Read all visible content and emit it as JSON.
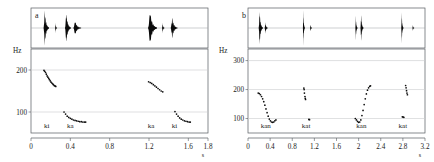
{
  "figure": {
    "caption_letters": [
      "a",
      "b"
    ],
    "kind": "speech-waveform-and-pitch-contour"
  },
  "panels": [
    {
      "letter": "a",
      "y_axis_label": "Hz",
      "x_unit_label": "s",
      "syllable_labels": [
        "ki",
        "ka",
        "ka",
        "ki"
      ],
      "syllable_x": [
        0.16,
        0.4,
        1.22,
        1.46
      ]
    },
    {
      "letter": "b",
      "y_axis_label": "Hz",
      "x_unit_label": "s",
      "syllable_labels": [
        "kan",
        "kat",
        "kan",
        "kat"
      ],
      "syllable_x": [
        0.32,
        1.05,
        2.05,
        2.8
      ]
    }
  ],
  "chart_data": [
    {
      "type": "line",
      "title": "a",
      "xlabel": "s",
      "ylabel": "Hz",
      "xlim": [
        0,
        1.8
      ],
      "ylim": [
        50,
        250
      ],
      "xticks": [
        0,
        0.4,
        0.8,
        1.2,
        1.6,
        1.8
      ],
      "xticklabels": [
        "0",
        "0.4",
        "0.8",
        "1.2",
        "1.6",
        "1.8"
      ],
      "yticks": [
        100,
        200
      ],
      "yticklabels": [
        "100",
        "200"
      ],
      "grid": true,
      "legend": "none",
      "annotations": [
        {
          "text": "ki",
          "x": 0.16,
          "y": 62
        },
        {
          "text": "ka",
          "x": 0.4,
          "y": 62
        },
        {
          "text": "ka",
          "x": 1.22,
          "y": 62
        },
        {
          "text": "ki",
          "x": 1.46,
          "y": 62
        }
      ],
      "series": [
        {
          "name": "f0-ki-1",
          "x": [
            0.132,
            0.14,
            0.148,
            0.156,
            0.164,
            0.172,
            0.18,
            0.188,
            0.196,
            0.204,
            0.212,
            0.22,
            0.228,
            0.236,
            0.244,
            0.252
          ],
          "y": [
            199,
            197,
            194,
            190,
            186,
            183,
            180,
            177,
            174,
            171,
            169,
            167,
            165,
            163,
            162,
            161
          ]
        },
        {
          "name": "f0-ka-1",
          "x": [
            0.336,
            0.352,
            0.368,
            0.384,
            0.4,
            0.416,
            0.432,
            0.448,
            0.464,
            0.48,
            0.496,
            0.512,
            0.528,
            0.544,
            0.556
          ],
          "y": [
            100,
            95,
            90,
            87,
            85,
            83,
            81,
            80,
            79,
            78,
            77,
            77,
            76,
            76,
            76
          ]
        },
        {
          "name": "f0-ka-2",
          "x": [
            1.196,
            1.212,
            1.228,
            1.244,
            1.26,
            1.276,
            1.292,
            1.308,
            1.324,
            1.34
          ],
          "y": [
            172,
            170,
            168,
            165,
            162,
            159,
            156,
            153,
            150,
            148
          ]
        },
        {
          "name": "f0-ki-2",
          "x": [
            1.464,
            1.48,
            1.496,
            1.512,
            1.528,
            1.544,
            1.56,
            1.576,
            1.592,
            1.608,
            1.62
          ],
          "y": [
            101,
            95,
            90,
            86,
            83,
            81,
            79,
            78,
            77,
            76,
            76
          ]
        }
      ],
      "waveform_bursts": [
        {
          "center": 0.155,
          "width": 0.055,
          "peak": 1.0
        },
        {
          "center": 0.255,
          "width": 0.02,
          "peak": 0.28
        },
        {
          "center": 0.375,
          "width": 0.06,
          "peak": 0.92
        },
        {
          "center": 0.47,
          "width": 0.08,
          "peak": 0.42
        },
        {
          "center": 1.235,
          "width": 0.09,
          "peak": 1.0
        },
        {
          "center": 1.345,
          "width": 0.025,
          "peak": 0.3
        },
        {
          "center": 1.455,
          "width": 0.07,
          "peak": 0.6
        }
      ]
    },
    {
      "type": "line",
      "title": "b",
      "xlabel": "s",
      "ylabel": "Hz",
      "xlim": [
        0,
        3.2
      ],
      "ylim": [
        50,
        340
      ],
      "xticks": [
        0,
        0.4,
        0.8,
        1.2,
        1.6,
        2,
        2.4,
        2.8,
        3.2
      ],
      "xticklabels": [
        "0",
        "0.4",
        "0.8",
        "1.2",
        "1.6",
        "2",
        "2.4",
        "2.8",
        "3.2"
      ],
      "yticks": [
        100,
        200,
        300
      ],
      "yticklabels": [
        "100",
        "200",
        "300"
      ],
      "grid": true,
      "legend": "none",
      "annotations": [
        {
          "text": "kan",
          "x": 0.32,
          "y": 66
        },
        {
          "text": "kat",
          "x": 1.05,
          "y": 66
        },
        {
          "text": "kan",
          "x": 2.05,
          "y": 66
        },
        {
          "text": "kat",
          "x": 2.8,
          "y": 66
        }
      ],
      "series": [
        {
          "name": "f0-kan-1",
          "x": [
            0.185,
            0.205,
            0.225,
            0.245,
            0.265,
            0.285,
            0.305,
            0.325,
            0.345,
            0.365,
            0.385,
            0.405,
            0.425,
            0.445,
            0.465,
            0.485,
            0.505
          ],
          "y": [
            188,
            186,
            182,
            176,
            168,
            158,
            146,
            133,
            120,
            108,
            98,
            92,
            88,
            87,
            88,
            92,
            95
          ]
        },
        {
          "name": "f0-kat-1-upper",
          "x": [
            1.01,
            1.015,
            1.02,
            1.03,
            1.035,
            1.04
          ],
          "y": [
            205,
            200,
            188,
            176,
            170,
            166
          ]
        },
        {
          "name": "f0-kat-1-lower",
          "x": [
            1.1,
            1.112
          ],
          "y": [
            97,
            96
          ]
        },
        {
          "name": "f0-kan-2",
          "x": [
            1.94,
            1.96,
            1.98,
            2.0,
            2.02,
            2.04,
            2.06,
            2.08,
            2.1,
            2.12,
            2.14,
            2.16,
            2.18,
            2.2,
            2.215
          ],
          "y": [
            100,
            95,
            90,
            87,
            88,
            95,
            110,
            128,
            148,
            168,
            185,
            198,
            206,
            211,
            213
          ]
        },
        {
          "name": "f0-kat-2-upper",
          "x": [
            2.85,
            2.858,
            2.866,
            2.874,
            2.882
          ],
          "y": [
            214,
            206,
            196,
            188,
            182
          ]
        },
        {
          "name": "f0-kat-2-lower",
          "x": [
            2.79,
            2.805,
            2.818
          ],
          "y": [
            106,
            105,
            104
          ]
        }
      ],
      "waveform_bursts": [
        {
          "center": 0.23,
          "width": 0.075,
          "peak": 1.0
        },
        {
          "center": 0.33,
          "width": 0.06,
          "peak": 0.32
        },
        {
          "center": 1.01,
          "width": 0.028,
          "peak": 1.0
        },
        {
          "center": 1.14,
          "width": 0.018,
          "peak": 0.22
        },
        {
          "center": 1.96,
          "width": 0.04,
          "peak": 0.7
        },
        {
          "center": 2.06,
          "width": 0.055,
          "peak": 0.8
        },
        {
          "center": 2.79,
          "width": 0.04,
          "peak": 0.9
        },
        {
          "center": 2.99,
          "width": 0.02,
          "peak": 0.18
        }
      ]
    }
  ]
}
